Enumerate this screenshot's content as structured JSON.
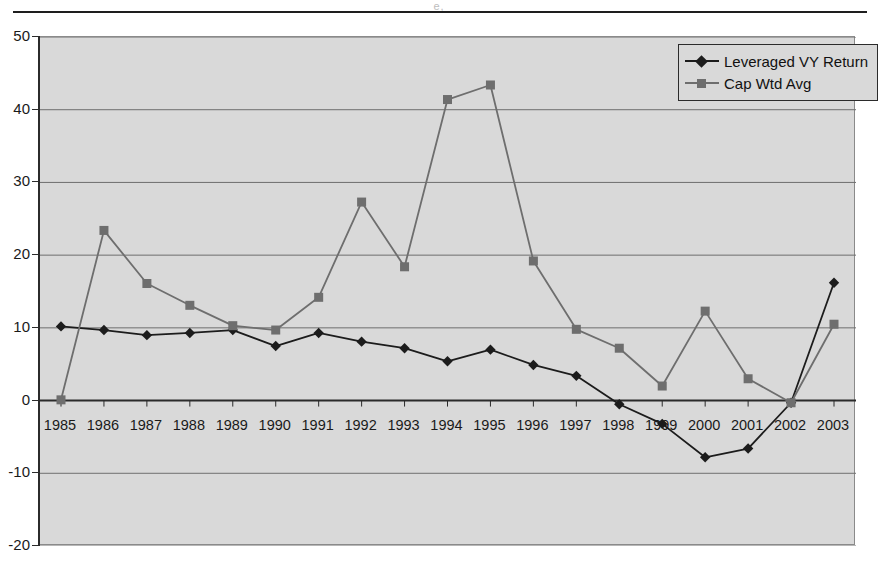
{
  "page": {
    "header_glyph": "e,"
  },
  "legend": {
    "position": "top-right",
    "entries": [
      {
        "label": "Leveraged VY Return",
        "color": "#1c1c1c",
        "marker": "diamond"
      },
      {
        "label": "Cap Wtd Avg",
        "color": "#6e6e6e",
        "marker": "square"
      }
    ]
  },
  "chart_data": {
    "type": "line",
    "title": "",
    "subtitle": "",
    "xlabel": "",
    "ylabel": "",
    "grid": true,
    "legend_position": "top-right",
    "plot_background": "#d9d9d9",
    "ylim": [
      -20,
      50
    ],
    "ytick_labels": [
      "50",
      "40",
      "30",
      "20",
      "10",
      "0",
      "-10",
      "-20"
    ],
    "yticks": [
      50,
      40,
      30,
      20,
      10,
      0,
      -10,
      -20
    ],
    "categories": [
      "1985",
      "1986",
      "1987",
      "1988",
      "1989",
      "1990",
      "1991",
      "1992",
      "1993",
      "1994",
      "1995",
      "1996",
      "1997",
      "1998",
      "1999",
      "2000",
      "2001",
      "2002",
      "2003"
    ],
    "series": [
      {
        "name": "Leveraged VY Return",
        "color": "#1c1c1c",
        "marker": "diamond",
        "values": [
          10.2,
          9.7,
          9.0,
          9.3,
          9.7,
          7.5,
          9.3,
          8.1,
          7.2,
          5.4,
          7.0,
          4.9,
          3.4,
          -0.5,
          -3.2,
          -7.8,
          -6.6,
          -0.3,
          16.2
        ]
      },
      {
        "name": "Cap Wtd Avg",
        "color": "#6e6e6e",
        "marker": "square",
        "values": [
          0.1,
          23.4,
          16.1,
          13.1,
          10.3,
          9.7,
          14.2,
          27.3,
          18.4,
          41.4,
          43.4,
          19.2,
          9.8,
          7.2,
          2.0,
          12.3,
          3.0,
          -0.3,
          10.5
        ]
      }
    ]
  }
}
